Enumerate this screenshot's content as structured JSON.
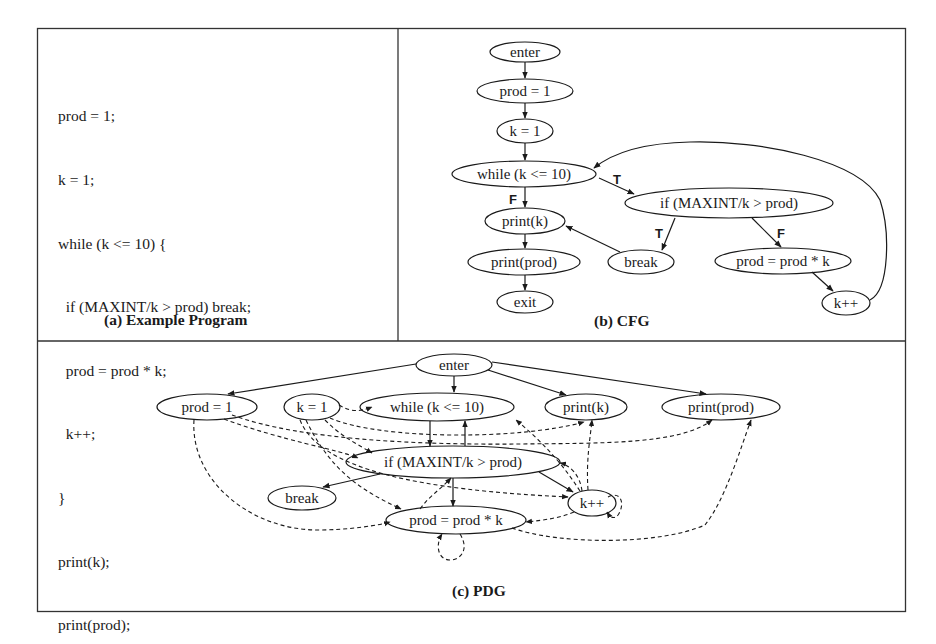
{
  "panels": {
    "a": {
      "caption": "(a) Example Program",
      "code_lines": [
        "prod = 1;",
        "k = 1;",
        "while (k <= 10) {",
        "  if (MAXINT/k > prod) break;",
        "  prod = prod * k;",
        "  k++;",
        "}",
        "print(k);",
        "print(prod);"
      ]
    },
    "b": {
      "caption": "(b) CFG",
      "nodes": {
        "enter": "enter",
        "prod1": "prod = 1",
        "k1": "k = 1",
        "while": "while (k <= 10)",
        "if": "if (MAXINT/k > prod)",
        "printk": "print(k)",
        "printprod": "print(prod)",
        "break": "break",
        "prodmul": "prod = prod * k",
        "kpp": "k++",
        "exit": "exit"
      },
      "edge_labels": {
        "while_if": "T",
        "while_printk": "F",
        "if_break": "T",
        "if_prodmul": "F"
      }
    },
    "c": {
      "caption": "(c) PDG",
      "nodes": {
        "enter": "enter",
        "prod1": "prod = 1",
        "k1": "k = 1",
        "while": "while (k <= 10)",
        "printk": "print(k)",
        "printprod": "print(prod)",
        "if": "if (MAXINT/k > prod)",
        "break": "break",
        "kpp": "k++",
        "prodmul": "prod = prod * k"
      },
      "legend": {
        "solid": "control dependence",
        "dashed": "data dependence"
      }
    }
  }
}
